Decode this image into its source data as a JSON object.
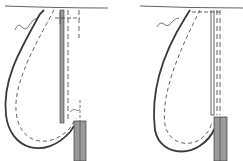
{
  "diagram": {
    "type": "technical-line-drawing",
    "panels": [
      {
        "name": "left-diagram",
        "position": "left"
      },
      {
        "name": "right-diagram",
        "position": "right"
      }
    ],
    "colors": {
      "line": "#3a3a3a",
      "fill_strip": "#9a9a9a",
      "background": "#ffffff"
    }
  }
}
